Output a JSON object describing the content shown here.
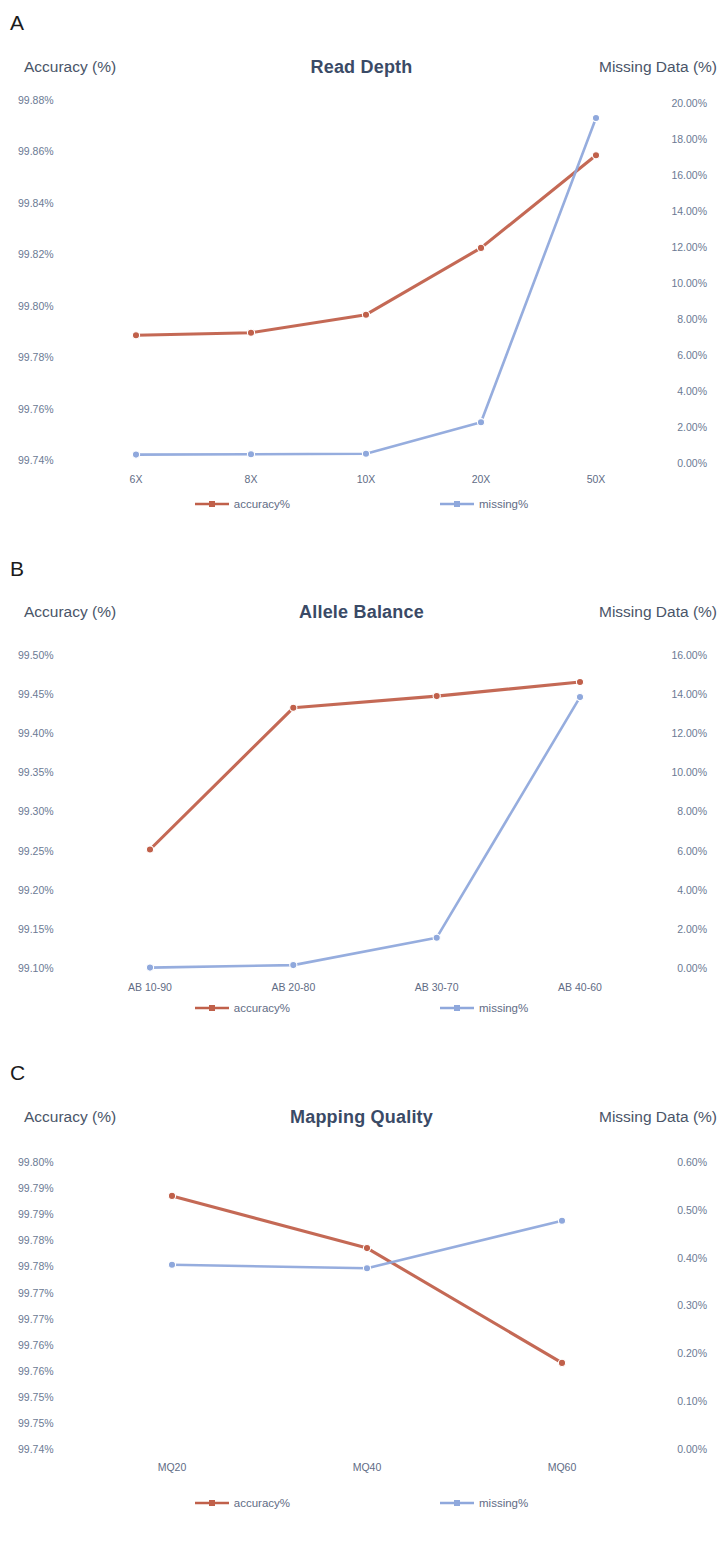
{
  "figure": {
    "panels": [
      {
        "letter": "A",
        "title": "Read Depth",
        "left_axis_title": "Accuracy (%)",
        "right_axis_title": "Missing Data (%)",
        "left_ticks": [
          "99.88%",
          "99.86%",
          "99.84%",
          "99.82%",
          "99.80%",
          "99.78%",
          "99.76%",
          "99.74%"
        ],
        "right_ticks": [
          "20.00%",
          "18.00%",
          "16.00%",
          "14.00%",
          "12.00%",
          "10.00%",
          "8.00%",
          "6.00%",
          "4.00%",
          "2.00%",
          "0.00%"
        ],
        "categories": [
          "6X",
          "8X",
          "10X",
          "20X",
          "50X"
        ],
        "legend": [
          {
            "label": "accuracy%",
            "color": "#c0604a"
          },
          {
            "label": "missing%",
            "color": "#8fa8dc"
          }
        ]
      },
      {
        "letter": "B",
        "title": "Allele Balance",
        "left_axis_title": "Accuracy (%)",
        "right_axis_title": "Missing Data (%)",
        "left_ticks": [
          "99.50%",
          "99.45%",
          "99.40%",
          "99.35%",
          "99.30%",
          "99.25%",
          "99.20%",
          "99.15%",
          "99.10%"
        ],
        "right_ticks": [
          "16.00%",
          "14.00%",
          "12.00%",
          "10.00%",
          "8.00%",
          "6.00%",
          "4.00%",
          "2.00%",
          "0.00%"
        ],
        "categories": [
          "AB 10-90",
          "AB 20-80",
          "AB 30-70",
          "AB 40-60"
        ],
        "legend": [
          {
            "label": "accuracy%",
            "color": "#c0604a"
          },
          {
            "label": "missing%",
            "color": "#8fa8dc"
          }
        ]
      },
      {
        "letter": "C",
        "title": "Mapping  Quality",
        "left_axis_title": "Accuracy (%)",
        "right_axis_title": "Missing Data (%)",
        "left_ticks": [
          "99.80%",
          "99.79%",
          "99.79%",
          "99.78%",
          "99.78%",
          "99.77%",
          "99.77%",
          "99.76%",
          "99.76%",
          "99.75%",
          "99.75%",
          "99.74%"
        ],
        "right_ticks": [
          "0.60%",
          "0.50%",
          "0.40%",
          "0.30%",
          "0.20%",
          "0.10%",
          "0.00%"
        ],
        "categories": [
          "MQ20",
          "MQ40",
          "MQ60"
        ],
        "legend": [
          {
            "label": "accuracy%",
            "color": "#c0604a"
          },
          {
            "label": "missing%",
            "color": "#8fa8dc"
          }
        ]
      }
    ]
  },
  "chart_data": [
    {
      "type": "line",
      "title": "Read Depth",
      "panel": "A",
      "xlabel": "",
      "ylabel": "Accuracy (%)",
      "y2label": "Missing Data (%)",
      "categories": [
        "6X",
        "8X",
        "10X",
        "20X",
        "50X"
      ],
      "ylim": [
        99.74,
        99.88
      ],
      "y2lim": [
        0.0,
        20.0
      ],
      "grid": false,
      "legend_position": "bottom",
      "series": [
        {
          "name": "accuracy%",
          "axis": "left",
          "color": "#c0604a",
          "values": [
            99.7885,
            99.7895,
            99.7965,
            99.8225,
            99.8585
          ]
        },
        {
          "name": "missing%",
          "axis": "right",
          "color": "#8fa8dc",
          "values": [
            0.3,
            0.32,
            0.35,
            2.1,
            19.0
          ]
        }
      ]
    },
    {
      "type": "line",
      "title": "Allele Balance",
      "panel": "B",
      "xlabel": "",
      "ylabel": "Accuracy (%)",
      "y2label": "Missing Data (%)",
      "categories": [
        "AB 10-90",
        "AB 20-80",
        "AB 30-70",
        "AB 40-60"
      ],
      "ylim": [
        99.1,
        99.5
      ],
      "y2lim": [
        0.0,
        16.0
      ],
      "grid": false,
      "legend_position": "bottom",
      "series": [
        {
          "name": "accuracy%",
          "axis": "left",
          "color": "#c0604a",
          "values": [
            99.2515,
            99.4325,
            99.4475,
            99.4655
          ]
        },
        {
          "name": "missing%",
          "axis": "right",
          "color": "#8fa8dc",
          "values": [
            0.02,
            0.15,
            1.55,
            13.85
          ]
        }
      ]
    },
    {
      "type": "line",
      "title": "Mapping  Quality",
      "panel": "C",
      "xlabel": "",
      "ylabel": "Accuracy (%)",
      "y2label": "Missing Data (%)",
      "categories": [
        "MQ20",
        "MQ40",
        "MQ60"
      ],
      "ylim": [
        99.74,
        99.795
      ],
      "y2lim": [
        0.0,
        0.6
      ],
      "grid": false,
      "legend_position": "bottom",
      "series": [
        {
          "name": "accuracy%",
          "axis": "left",
          "color": "#c0604a",
          "values": [
            99.7885,
            99.7785,
            99.7565
          ]
        },
        {
          "name": "missing%",
          "axis": "right",
          "color": "#8fa8dc",
          "values": [
            0.385,
            0.378,
            0.477
          ]
        }
      ]
    }
  ]
}
